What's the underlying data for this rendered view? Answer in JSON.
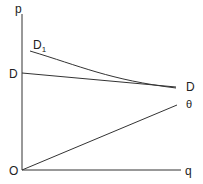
{
  "diagram": {
    "axes": {
      "y_label": "p",
      "x_label": "q",
      "origin_label": "O"
    },
    "curves": {
      "d_left_label": "D",
      "d_right_label": "D",
      "d1_label_main": "D",
      "d1_label_sub": "1",
      "theta_label": "θ"
    },
    "colors": {
      "line": "#333333",
      "background": "#ffffff"
    }
  }
}
